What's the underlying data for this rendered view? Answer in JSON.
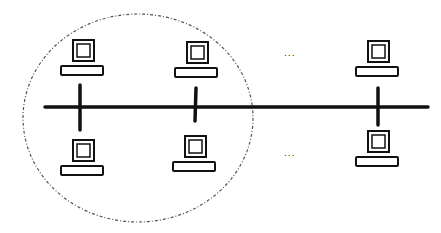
{
  "diagram": {
    "type": "bus-network-topology",
    "bus": {
      "label": ""
    },
    "group": {
      "label": "",
      "members": [
        "pc-top-1",
        "pc-top-2",
        "pc-bottom-1",
        "pc-bottom-2"
      ]
    },
    "computers": [
      {
        "id": "pc-top-1",
        "row": "top",
        "column": 1
      },
      {
        "id": "pc-top-2",
        "row": "top",
        "column": 2
      },
      {
        "id": "pc-top-n",
        "row": "top",
        "column": "n"
      },
      {
        "id": "pc-bottom-1",
        "row": "bottom",
        "column": 1
      },
      {
        "id": "pc-bottom-2",
        "row": "bottom",
        "column": 2
      },
      {
        "id": "pc-bottom-n",
        "row": "bottom",
        "column": "n"
      }
    ],
    "ellipsis_top": "...",
    "ellipsis_bottom": "...",
    "colors": {
      "line": "#111111",
      "group_border": "#555555",
      "background": "#ffffff"
    }
  }
}
